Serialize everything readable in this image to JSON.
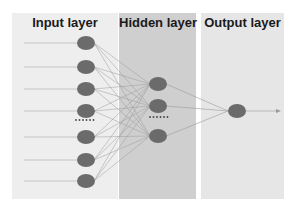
{
  "layers": [
    {
      "label": "Input layer",
      "color": "#eeeeee"
    },
    {
      "label": "Hidden layer",
      "color": "#cfcfcf"
    },
    {
      "label": "Output layer",
      "color": "#e6e6e6"
    }
  ],
  "node_color": "#6b6b6b",
  "ellipsis": "......"
}
